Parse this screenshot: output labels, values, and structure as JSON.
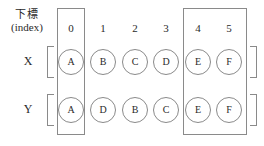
{
  "figure": {
    "title_label": {
      "cjk": "下標",
      "latin": "(index)"
    },
    "columns": [
      "0",
      "1",
      "2",
      "3",
      "4",
      "5"
    ],
    "rows": [
      {
        "name": "X",
        "label": "X",
        "cells": [
          "A",
          "B",
          "C",
          "D",
          "E",
          "F"
        ]
      },
      {
        "name": "Y",
        "label": "Y",
        "cells": [
          "A",
          "D",
          "B",
          "C",
          "E",
          "F"
        ]
      }
    ],
    "highlights": [
      {
        "name": "column-0",
        "columns": [
          "0"
        ]
      },
      {
        "name": "columns-4-5",
        "columns": [
          "4",
          "5"
        ]
      }
    ],
    "colors": {
      "stroke": "#8a8a8a",
      "text": "#2a2a2a",
      "background": "#ffffff"
    }
  }
}
